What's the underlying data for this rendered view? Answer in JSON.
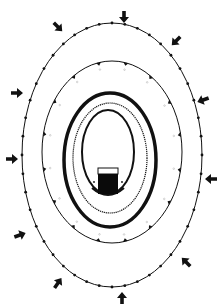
{
  "diagram": {
    "type": "concentric-zones",
    "colors": {
      "background": "#ffffff",
      "ink": "#111111",
      "core": "#0a0a0a"
    },
    "outer_ring": {
      "cx": 112,
      "cy": 155,
      "rx": 90,
      "ry": 132,
      "marker": "dot",
      "marker_count": 44,
      "stroke_width": 1
    },
    "second_ring": {
      "cx": 112,
      "cy": 152,
      "rx": 70,
      "ry": 91,
      "marker": "half-triangle",
      "marker_count": 16,
      "stroke_width": 1
    },
    "thick_ring": {
      "cx": 110,
      "cy": 160,
      "rx": 46,
      "ry": 67,
      "stroke_width": 3.5
    },
    "dotted_ring": {
      "cx": 110,
      "cy": 158,
      "rx": 37,
      "ry": 55,
      "stroke_width": 1.2,
      "dash": "1.2 0.8"
    },
    "inner_ring": {
      "cx": 108,
      "cy": 152,
      "rx": 26,
      "ry": 42,
      "stroke_width": 2
    },
    "core_block": {
      "x": 98,
      "y": 168,
      "width": 20,
      "height": 26,
      "cap_height": 6,
      "label": ""
    },
    "arrows": [
      {
        "x": 58,
        "y": 27,
        "angle": 135
      },
      {
        "x": 124,
        "y": 17,
        "angle": 180
      },
      {
        "x": 176,
        "y": 41,
        "angle": 225
      },
      {
        "x": 203,
        "y": 100,
        "angle": 250
      },
      {
        "x": 211,
        "y": 179,
        "angle": 270
      },
      {
        "x": 186,
        "y": 262,
        "angle": 315
      },
      {
        "x": 122,
        "y": 298,
        "angle": 0
      },
      {
        "x": 58,
        "y": 283,
        "angle": 35
      },
      {
        "x": 20,
        "y": 235,
        "angle": 70
      },
      {
        "x": 12,
        "y": 159,
        "angle": 90
      },
      {
        "x": 17,
        "y": 93,
        "angle": 90
      }
    ]
  }
}
